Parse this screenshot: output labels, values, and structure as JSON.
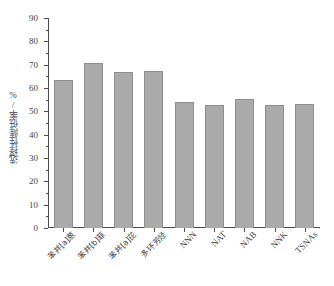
{
  "chart_data": {
    "type": "bar",
    "title": "",
    "subtitle": "",
    "xlabel": "",
    "ylabel": "选择性降低率/%",
    "ylim": [
      0,
      90
    ],
    "ytick_step": 10,
    "grid": false,
    "legend": "none",
    "bar_color": "#aaaaaa",
    "bar_edge_color": "#8d8d8d",
    "axis_color": "#4b4b4b",
    "categories": [
      "苯并[a]蒽",
      "苯并[b]菲",
      "苯并[a]芘",
      "多环芳烃",
      "NNN",
      "NAT",
      "NAB",
      "NNK",
      "TSNAs"
    ],
    "values": [
      63.3,
      70.6,
      66.8,
      67.2,
      53.9,
      52.8,
      55.3,
      52.7,
      53.1
    ],
    "yticks": [
      "0",
      "10",
      "20",
      "30",
      "40",
      "50",
      "60",
      "70",
      "80",
      "90"
    ]
  }
}
